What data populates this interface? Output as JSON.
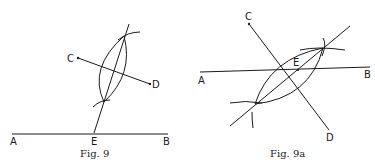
{
  "figures": [
    {
      "caption": "Fig. 9",
      "labels": {
        "A": "A",
        "B": "B",
        "C": "C",
        "D": "D",
        "E": "E"
      }
    },
    {
      "caption": "Fig. 9a",
      "labels": {
        "A": "A",
        "B": "B",
        "C": "C",
        "D": "D",
        "E": "E"
      }
    }
  ]
}
